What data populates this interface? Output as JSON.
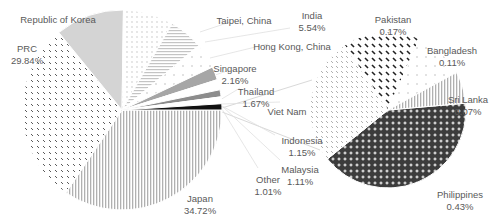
{
  "chart_data": {
    "type": "pie-of-pie",
    "title": "",
    "primary_pie": {
      "center": [
        122,
        110
      ],
      "radius": 100,
      "slices": [
        {
          "name": "Japan",
          "value": 34.72,
          "label": "34.72%",
          "pattern": "vlines",
          "color": "#b0b0b0"
        },
        {
          "name": "PRC",
          "value": 29.84,
          "label": "29.84%",
          "pattern": "dashes",
          "color": "#5a5a5a"
        },
        {
          "name": "Republic of Korea",
          "value": 11.2,
          "label": "",
          "pattern": "solid",
          "color": "#d4d4d4"
        },
        {
          "name": "Taipei, China",
          "value": 8.2,
          "label": "",
          "pattern": "dots",
          "color": "#bdbdbd"
        },
        {
          "name": "India",
          "value": 5.54,
          "label": "5.54%",
          "pattern": "hlines",
          "color": "#c4c4c4"
        },
        {
          "name": "Hong Kong, China",
          "value": 4.1,
          "label": "",
          "pattern": "sparse",
          "color": "#c8c8c8"
        },
        {
          "name": "Singapore",
          "value": 2.16,
          "label": "2.16%",
          "pattern": "solid",
          "color": "#a6a6a6"
        },
        {
          "name": "Thailand",
          "value": 1.67,
          "label": "1.67%",
          "pattern": "white",
          "color": "#ffffff"
        },
        {
          "name": "Indonesia",
          "value": 1.15,
          "label": "1.15%",
          "pattern": "solid",
          "color": "#8c8c8c"
        },
        {
          "name": "Malaysia",
          "value": 1.11,
          "label": "1.11%",
          "pattern": "white",
          "color": "#ffffff"
        },
        {
          "name": "Other",
          "value": 1.01,
          "label": "1.01%",
          "pattern": "solid",
          "color": "#111111"
        }
      ]
    },
    "secondary_pie": {
      "center": [
        388,
        110
      ],
      "radius": 78,
      "slices": [
        {
          "name": "Philippines",
          "value": 0.43,
          "label": "0.43%",
          "pattern": "crosses",
          "color": "#3c3c3c"
        },
        {
          "name": "Viet Nam",
          "value": 0.28,
          "label": "",
          "pattern": "lightdash",
          "color": "#9a9a9a"
        },
        {
          "name": "Pakistan",
          "value": 0.17,
          "label": "0.17%",
          "pattern": "bolddash",
          "color": "#222222"
        },
        {
          "name": "Bangladesh",
          "value": 0.11,
          "label": "0.11%",
          "pattern": "sparse",
          "color": "#b0b0b0"
        },
        {
          "name": "Sri Lanka",
          "value": 0.07,
          "label": "0.07%",
          "pattern": "vlines",
          "color": "#b5b5b5"
        }
      ]
    },
    "labels": [
      {
        "name": "Republic of Korea",
        "pct": "",
        "x": 58,
        "y": 14
      },
      {
        "name": "PRC",
        "pct": "29.84%",
        "x": 27,
        "y": 43
      },
      {
        "name": "Taipei, China",
        "pct": "",
        "x": 244,
        "y": 15
      },
      {
        "name": "India",
        "pct": "5.54%",
        "x": 312,
        "y": 10
      },
      {
        "name": "Hong Kong, China",
        "pct": "",
        "x": 292,
        "y": 41
      },
      {
        "name": "Singapore",
        "pct": "2.16%",
        "x": 235,
        "y": 63
      },
      {
        "name": "Thailand",
        "pct": "1.67%",
        "x": 256,
        "y": 86
      },
      {
        "name": "Viet Nam",
        "pct": "",
        "x": 287,
        "y": 106
      },
      {
        "name": "Indonesia",
        "pct": "1.15%",
        "x": 302,
        "y": 135
      },
      {
        "name": "Malaysia",
        "pct": "1.11%",
        "x": 300,
        "y": 164
      },
      {
        "name": "Other",
        "pct": "1.01%",
        "x": 268,
        "y": 174
      },
      {
        "name": "Japan",
        "pct": "34.72%",
        "x": 200,
        "y": 193
      },
      {
        "name": "Pakistan",
        "pct": "0.17%",
        "x": 393,
        "y": 14
      },
      {
        "name": "Bangladesh",
        "pct": "0.11%",
        "x": 452,
        "y": 45
      },
      {
        "name": "Sri Lanka",
        "pct": "0.07%",
        "x": 468,
        "y": 94
      },
      {
        "name": "Philippines",
        "pct": "0.43%",
        "x": 460,
        "y": 189
      }
    ],
    "legend": "none",
    "text_color": "#595959"
  }
}
